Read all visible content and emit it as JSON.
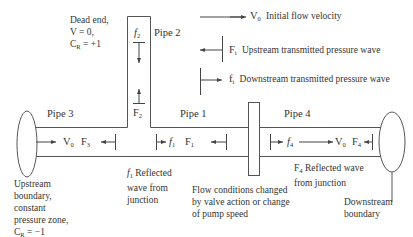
{
  "pipes": {
    "pipe1": "Pipe 1",
    "pipe2": "Pipe 2",
    "pipe3": "Pipe 3",
    "pipe4": "Pipe 4"
  },
  "legend": {
    "velocity": {
      "symbol": "V",
      "sub": "0",
      "label": "Initial flow velocity"
    },
    "upstream": {
      "symbol": "F",
      "sub": "i",
      "label": "Upstream transmitted pressure wave"
    },
    "downstream": {
      "symbol": "f",
      "sub": "i",
      "label": "Downstream transmitted pressure wave"
    }
  },
  "dead_end": {
    "line1": "Dead end,",
    "line2": "V = 0,",
    "line3_symbol": "C",
    "line3_sub": "R",
    "line3_rest": " = +1"
  },
  "wave_labels": {
    "f2": {
      "symbol": "f",
      "sub": "2"
    },
    "F2": {
      "symbol": "F",
      "sub": "2"
    },
    "V0_pipe3": {
      "symbol": "V",
      "sub": "0"
    },
    "F3": {
      "symbol": "F",
      "sub": "3"
    },
    "f1": {
      "symbol": "f",
      "sub": "1"
    },
    "F1": {
      "symbol": "F",
      "sub": "1"
    },
    "f4": {
      "symbol": "f",
      "sub": "4"
    },
    "V0_pipe4": {
      "symbol": "V",
      "sub": "0"
    },
    "F4": {
      "symbol": "F",
      "sub": "4"
    }
  },
  "annotations": {
    "f1_reflected": {
      "symbol": "f",
      "sub": "1",
      "line1": " Reflected",
      "line2": "wave from",
      "line3": "junction"
    },
    "F4_reflected": {
      "symbol": "F",
      "sub": "4",
      "line1": " Reflected wave",
      "line2": "from junction"
    },
    "flow_conditions": {
      "line1": "Flow conditions changed",
      "line2": "by valve action or change",
      "line3": "of pump speed"
    },
    "upstream_boundary": {
      "line1": "Upstream",
      "line2": "boundary,",
      "line3": "constant",
      "line4": "pressure zone,",
      "line5_symbol": "C",
      "line5_sub": "R",
      "line5_rest": " = −1"
    },
    "downstream_boundary": {
      "line1": "Downstream",
      "line2": "boundary"
    }
  },
  "colors": {
    "line": "#555555",
    "text": "#333333",
    "background": "#ffffff"
  }
}
